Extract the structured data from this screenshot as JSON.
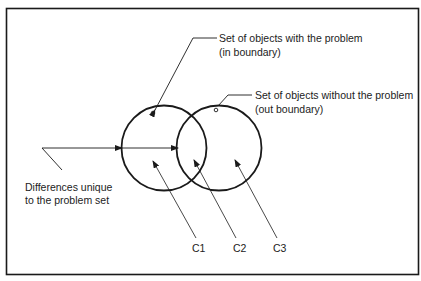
{
  "diagram": {
    "labels": {
      "in_set_line1": "Set of objects with the problem",
      "in_set_line2": "(in boundary)",
      "out_set_line1": "Set of objects without the problem",
      "out_set_line2": "(out boundary)",
      "diff_line1": "Differences unique",
      "diff_line2": "to the problem set",
      "c1": "C1",
      "c2": "C2",
      "c3": "C3"
    },
    "colors": {
      "stroke": "#1a1a1a",
      "background": "#ffffff"
    }
  }
}
